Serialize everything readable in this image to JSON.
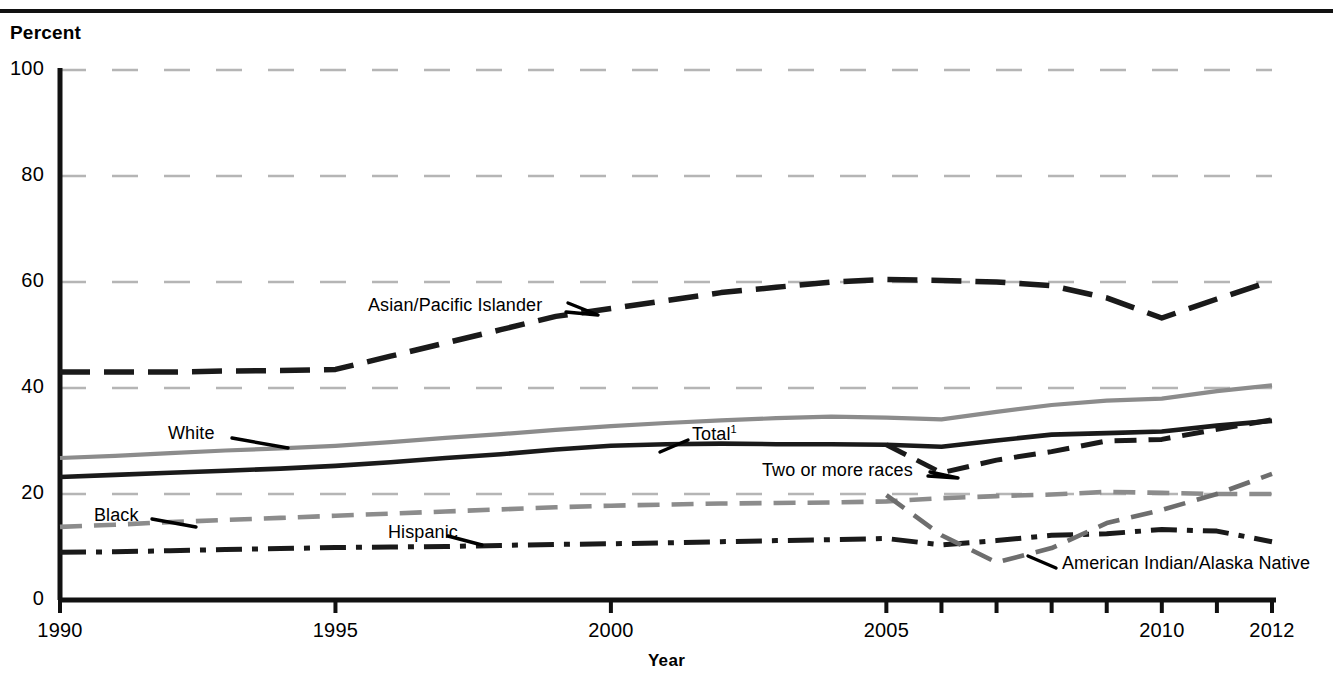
{
  "axis": {
    "y_title": "Percent",
    "x_title": "Year",
    "y_ticks": [
      "0",
      "20",
      "40",
      "60",
      "80",
      "100"
    ],
    "x_ticks": [
      "1990",
      "1995",
      "2000",
      "2005",
      "2010",
      "2012"
    ]
  },
  "labels": {
    "asian": "Asian/Pacific Islander",
    "white": "White",
    "total": "Total",
    "total_sup": "1",
    "two_or_more": "Two or more races",
    "black": "Black",
    "hispanic": "Hispanic",
    "aian": "American Indian/Alaska Native"
  },
  "colors": {
    "total": "#1a1a1a",
    "white": "#8c8c8c",
    "asian": "#1a1a1a",
    "black": "#8c8c8c",
    "hispanic": "#1a1a1a",
    "two_or_more": "#1a1a1a",
    "aian": "#6e6e6e",
    "grid": "#b5b5b5",
    "axis": "#111111"
  },
  "chart_data": {
    "type": "line",
    "title": "",
    "xlabel": "Year",
    "ylabel": "Percent",
    "xlim": [
      1990,
      2012
    ],
    "ylim": [
      0,
      100
    ],
    "yticks": [
      0,
      20,
      40,
      60,
      80,
      100
    ],
    "xticks": [
      1990,
      1995,
      2000,
      2005,
      2006,
      2007,
      2008,
      2009,
      2010,
      2011,
      2012
    ],
    "grid": "horizontal-dashed",
    "legend": "inline-annotations",
    "series": [
      {
        "name": "Asian/Pacific Islander",
        "style": "long-dash",
        "color": "#1a1a1a",
        "x": [
          1990,
          1991,
          1992,
          1993,
          1994,
          1995,
          1996,
          1997,
          1998,
          1999,
          2000,
          2001,
          2002,
          2003,
          2004,
          2005,
          2006,
          2007,
          2008,
          2009,
          2010,
          2011,
          2012
        ],
        "values": [
          43.0,
          43.0,
          43.0,
          43.2,
          43.3,
          43.5,
          46.0,
          48.5,
          51.0,
          53.5,
          55.0,
          56.5,
          58.0,
          59.0,
          60.0,
          60.5,
          60.3,
          60.0,
          59.3,
          57.0,
          53.2,
          56.8,
          60.2
        ]
      },
      {
        "name": "White",
        "style": "solid",
        "color": "#8c8c8c",
        "x": [
          1990,
          1991,
          1992,
          1993,
          1994,
          1995,
          1996,
          1997,
          1998,
          1999,
          2000,
          2001,
          2002,
          2003,
          2004,
          2005,
          2006,
          2007,
          2008,
          2009,
          2010,
          2011,
          2012
        ],
        "values": [
          26.8,
          27.2,
          27.7,
          28.2,
          28.6,
          29.1,
          29.8,
          30.6,
          31.3,
          32.1,
          32.8,
          33.4,
          33.9,
          34.3,
          34.6,
          34.4,
          34.1,
          35.5,
          36.8,
          37.6,
          38.0,
          39.4,
          40.5
        ]
      },
      {
        "name": "Total",
        "style": "solid",
        "color": "#1a1a1a",
        "x": [
          1990,
          1991,
          1992,
          1993,
          1994,
          1995,
          1996,
          1997,
          1998,
          1999,
          2000,
          2001,
          2002,
          2003,
          2004,
          2005,
          2006,
          2007,
          2008,
          2009,
          2010,
          2011,
          2012
        ],
        "values": [
          23.2,
          23.6,
          24.0,
          24.4,
          24.8,
          25.3,
          26.0,
          26.8,
          27.5,
          28.4,
          29.1,
          29.4,
          29.5,
          29.4,
          29.4,
          29.3,
          28.9,
          30.1,
          31.2,
          31.5,
          31.8,
          32.9,
          33.8
        ]
      },
      {
        "name": "Two or more races",
        "style": "dash",
        "color": "#1a1a1a",
        "x": [
          2005,
          2006,
          2007,
          2008,
          2009,
          2010,
          2011,
          2012
        ],
        "values": [
          29.3,
          24.0,
          26.4,
          28.0,
          30.0,
          30.3,
          32.2,
          34.0
        ]
      },
      {
        "name": "Black",
        "style": "dash",
        "color": "#8c8c8c",
        "x": [
          1990,
          1991,
          1992,
          1993,
          1994,
          1995,
          1996,
          1997,
          1998,
          1999,
          2000,
          2001,
          2002,
          2003,
          2004,
          2005,
          2006,
          2007,
          2008,
          2009,
          2010,
          2011,
          2012
        ],
        "values": [
          13.8,
          14.2,
          14.7,
          15.1,
          15.5,
          15.9,
          16.3,
          16.7,
          17.1,
          17.5,
          17.8,
          18.0,
          18.2,
          18.3,
          18.4,
          18.6,
          19.2,
          19.6,
          19.9,
          20.4,
          20.2,
          20.0,
          20.0
        ]
      },
      {
        "name": "Hispanic",
        "style": "dash-dot",
        "color": "#1a1a1a",
        "x": [
          1990,
          1991,
          1992,
          1993,
          1994,
          1995,
          1996,
          1997,
          1998,
          1999,
          2000,
          2001,
          2002,
          2003,
          2004,
          2005,
          2006,
          2007,
          2008,
          2009,
          2010,
          2011,
          2012
        ],
        "values": [
          9.0,
          9.1,
          9.3,
          9.5,
          9.7,
          9.9,
          10.0,
          10.1,
          10.3,
          10.5,
          10.6,
          10.8,
          11.0,
          11.2,
          11.4,
          11.6,
          10.4,
          11.2,
          12.2,
          12.5,
          13.3,
          13.0,
          11.0
        ]
      },
      {
        "name": "American Indian/Alaska Native",
        "style": "dash",
        "color": "#6e6e6e",
        "x": [
          2005,
          2006,
          2007,
          2008,
          2009,
          2010,
          2011,
          2012
        ],
        "values": [
          19.8,
          12.2,
          7.1,
          9.8,
          14.5,
          17.0,
          20.0,
          23.8
        ]
      }
    ]
  }
}
